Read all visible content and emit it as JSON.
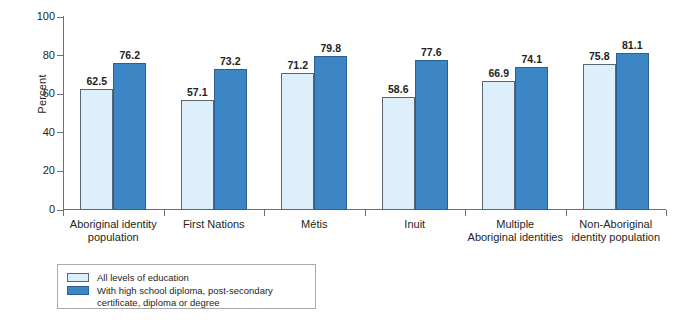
{
  "chart_data": {
    "type": "bar",
    "title": "",
    "xlabel": "",
    "ylabel": "Percent",
    "ylim": [
      0,
      100
    ],
    "yticks": [
      0,
      20,
      40,
      60,
      80,
      100
    ],
    "grid": false,
    "legend_position": "bottom-left",
    "categories": [
      "Aboriginal identity\npopulation",
      "First Nations",
      "Métis",
      "Inuit",
      "Multiple\nAboriginal identities",
      "Non-Aboriginal\nidentity population"
    ],
    "series": [
      {
        "name": "All levels of education",
        "color": "#ddeffb",
        "values": [
          62.5,
          57.1,
          71.2,
          58.6,
          66.9,
          75.8
        ]
      },
      {
        "name": "With high school diploma, post-secondary\ncertificate, diploma or degree",
        "color": "#3d86c6",
        "values": [
          76.2,
          73.2,
          79.8,
          77.6,
          74.1,
          81.1
        ]
      }
    ]
  },
  "axis": {
    "y_title": "Percent",
    "y_tick_labels": [
      "100",
      "80",
      "60",
      "40",
      "20",
      "0"
    ]
  },
  "legend": {
    "items": [
      {
        "label": "All levels of education",
        "color": "#ddeffb"
      },
      {
        "label": "With high school diploma, post-secondary\ncertificate, diploma or degree",
        "color": "#3d86c6"
      }
    ]
  },
  "colors": {
    "light_bar": "#ddeffb",
    "light_bar_border": "#5b6670",
    "dark_bar": "#3d86c6",
    "dark_bar_border": "#2c5f92",
    "axis": "#6d6e71",
    "text": "#231f20",
    "background": "#ffffff"
  }
}
